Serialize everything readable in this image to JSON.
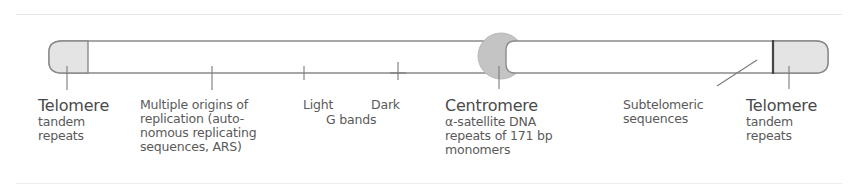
{
  "diagram": {
    "type": "chromosome-schematic",
    "colors": {
      "outline": "#8a8a8a",
      "telomere_fill": "#e4e4e4",
      "centromere_fill": "#c4c4c4",
      "text": "#555555",
      "background": "#ffffff"
    },
    "labels": {
      "telomere_left": {
        "title": "Telomere",
        "lines": [
          "tandem",
          "repeats"
        ]
      },
      "origins": {
        "lines": [
          "Multiple origins  of",
          "replication (auto-",
          "nomous replicating",
          "sequences, ARS)"
        ]
      },
      "light": "Light",
      "dark": "Dark",
      "g_bands": "G bands",
      "centromere": {
        "title": "Centromere",
        "lines": [
          "α-satellite DNA",
          "repeats of 171 bp",
          "monomers"
        ]
      },
      "subtelomeric": {
        "lines": [
          "Subtelomeric",
          "sequences"
        ]
      },
      "telomere_right": {
        "title": "Telomere",
        "lines": [
          "tandem",
          "repeats"
        ]
      }
    }
  }
}
